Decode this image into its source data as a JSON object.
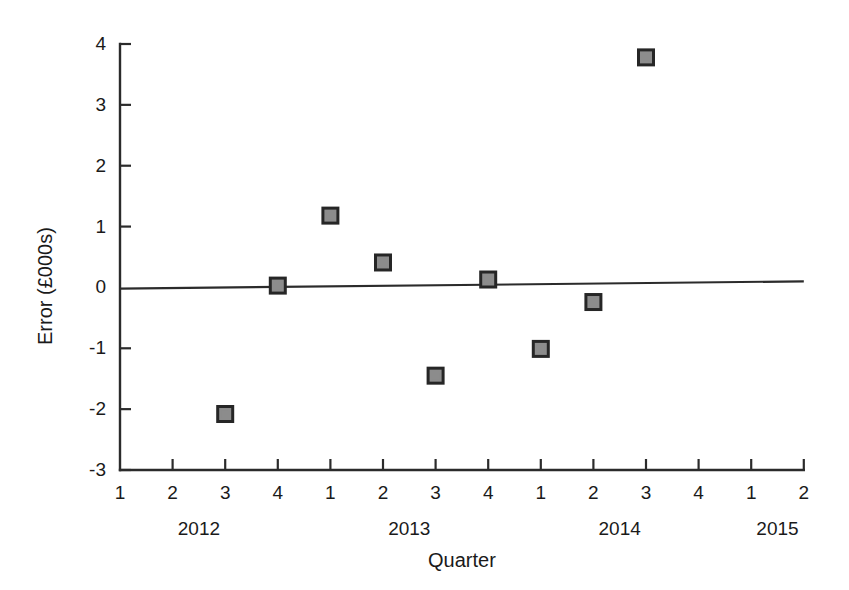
{
  "chart_data": {
    "type": "scatter",
    "title": "",
    "xlabel": "Quarter",
    "ylabel": "Error (£000s)",
    "ylim": [
      -3,
      4
    ],
    "yticks": [
      "4",
      "3",
      "2",
      "1",
      "0",
      "-1",
      "-2",
      "-3"
    ],
    "ytick_values": [
      4,
      3,
      2,
      1,
      0,
      -1,
      -2,
      -3
    ],
    "grid": false,
    "legend": "none",
    "xtick_labels": [
      "1",
      "2",
      "3",
      "4",
      "1",
      "2",
      "3",
      "4",
      "1",
      "2",
      "3",
      "4",
      "1",
      "2"
    ],
    "year_groups": [
      {
        "label": "2012",
        "start_index": 0,
        "end_index": 3
      },
      {
        "label": "2013",
        "start_index": 4,
        "end_index": 7
      },
      {
        "label": "2014",
        "start_index": 8,
        "end_index": 11
      },
      {
        "label": "2015",
        "start_index": 12,
        "end_index": 13
      }
    ],
    "points": [
      {
        "x_index": 2,
        "quarter": "3",
        "year": "2012",
        "y": -2.08
      },
      {
        "x_index": 3,
        "quarter": "4",
        "year": "2012",
        "y": 0.03
      },
      {
        "x_index": 4,
        "quarter": "1",
        "year": "2013",
        "y": 1.18
      },
      {
        "x_index": 5,
        "quarter": "2",
        "year": "2013",
        "y": 0.41
      },
      {
        "x_index": 6,
        "quarter": "3",
        "year": "2013",
        "y": -1.45
      },
      {
        "x_index": 7,
        "quarter": "4",
        "year": "2013",
        "y": 0.13
      },
      {
        "x_index": 8,
        "quarter": "1",
        "year": "2014",
        "y": -1.01
      },
      {
        "x_index": 9,
        "quarter": "2",
        "year": "2014",
        "y": -0.24
      },
      {
        "x_index": 10,
        "quarter": "3",
        "year": "2014",
        "y": 3.78
      }
    ],
    "trend_line": {
      "y_at_left": -0.02,
      "y_at_right": 0.1,
      "x_start_index": 0,
      "x_end_index": 13
    },
    "colors": {
      "axis": "#2b2b2b",
      "marker_fill": "#8c8c8c",
      "marker_edge": "#262626",
      "trend_line": "#2b2b2b",
      "background": "#ffffff"
    }
  }
}
